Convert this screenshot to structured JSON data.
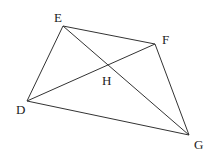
{
  "diagram": {
    "points": {
      "E": {
        "label": "E",
        "x": 63,
        "y": 26,
        "lx": 54,
        "ly": 22
      },
      "F": {
        "label": "F",
        "x": 155,
        "y": 44,
        "lx": 162,
        "ly": 44
      },
      "D": {
        "label": "D",
        "x": 27,
        "y": 101,
        "lx": 16,
        "ly": 114
      },
      "G": {
        "label": "G",
        "x": 189,
        "y": 135,
        "lx": 194,
        "ly": 149
      },
      "H": {
        "label": "H",
        "x": 108,
        "y": 65,
        "lx": 102,
        "ly": 85
      }
    },
    "segments": [
      {
        "from": "E",
        "to": "F"
      },
      {
        "from": "F",
        "to": "G"
      },
      {
        "from": "G",
        "to": "D"
      },
      {
        "from": "D",
        "to": "E"
      },
      {
        "from": "E",
        "to": "G"
      },
      {
        "from": "D",
        "to": "F"
      }
    ],
    "colors": {
      "line": "#333333",
      "label": "#222222",
      "background": "#ffffff"
    }
  }
}
